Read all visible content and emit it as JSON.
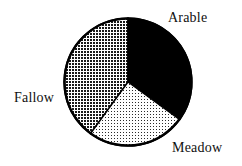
{
  "chart_data": {
    "type": "pie",
    "title": "",
    "subtitle": "",
    "xlabel": "",
    "ylabel": "",
    "legend_position": "none",
    "grid": false,
    "labels_outside": true,
    "start_angle_deg": 0,
    "direction": "clockwise",
    "categories": [
      "Arable",
      "Meadow",
      "Fallow"
    ],
    "values": [
      35,
      25,
      40
    ],
    "slices": [
      {
        "label": "Arable",
        "value": 35,
        "percent": 35,
        "start_deg": 0,
        "end_deg": 126,
        "fill": "solid-black",
        "color": "#000000",
        "label_position": "top-right"
      },
      {
        "label": "Meadow",
        "value": 25,
        "percent": 25,
        "start_deg": 126,
        "end_deg": 216,
        "fill": "light-dot-screen",
        "color": "#d9d9d9",
        "label_position": "bottom-right"
      },
      {
        "label": "Fallow",
        "value": 40,
        "percent": 40,
        "start_deg": 216,
        "end_deg": 360,
        "fill": "dense-crosshatch",
        "color": "#7a7a7a",
        "label_position": "left"
      }
    ],
    "geometry": {
      "center_x": 128,
      "center_y": 82,
      "radius": 64,
      "outline_color": "#000000",
      "outline_width": 2
    }
  },
  "labels": {
    "arable": "Arable",
    "fallow": "Fallow",
    "meadow": "Meadow"
  }
}
